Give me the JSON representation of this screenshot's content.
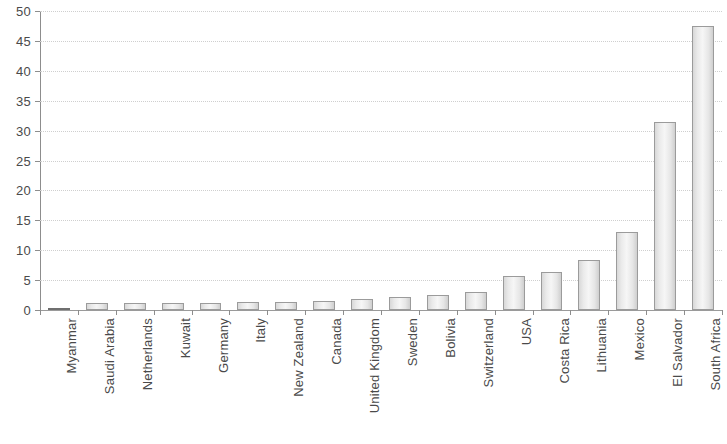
{
  "chart_data": {
    "type": "bar",
    "title": "",
    "subtitle": "",
    "xlabel": "",
    "ylabel": "",
    "ylim": [
      0,
      50
    ],
    "y_ticks": [
      0,
      5,
      10,
      15,
      20,
      25,
      30,
      35,
      40,
      45,
      50
    ],
    "grid": true,
    "legend": false,
    "legend_position": "none",
    "categories": [
      "Myanmar",
      "Saudi Arabia",
      "Netherlands",
      "Kuwait",
      "Germany",
      "Italy",
      "New Zealand",
      "Canada",
      "United Kingdom",
      "Sweden",
      "Bolivia",
      "Switzerland",
      "USA",
      "Costa Rica",
      "Lithuania",
      "Mexico",
      "El Salvador",
      "South Africa"
    ],
    "values": [
      0.2,
      1.1,
      1.2,
      1.2,
      1.2,
      1.3,
      1.4,
      1.5,
      1.8,
      2.2,
      2.5,
      3.0,
      5.7,
      6.3,
      8.3,
      13.0,
      31.4,
      47.5
    ]
  },
  "style": {
    "bar_fill": "#eaeaea",
    "bar_stroke": "#9b9b9b",
    "axis_color": "#8d8d8d",
    "grid_color": "#cfcfcf",
    "text_color": "#4a4a4a",
    "background": "#ffffff"
  }
}
